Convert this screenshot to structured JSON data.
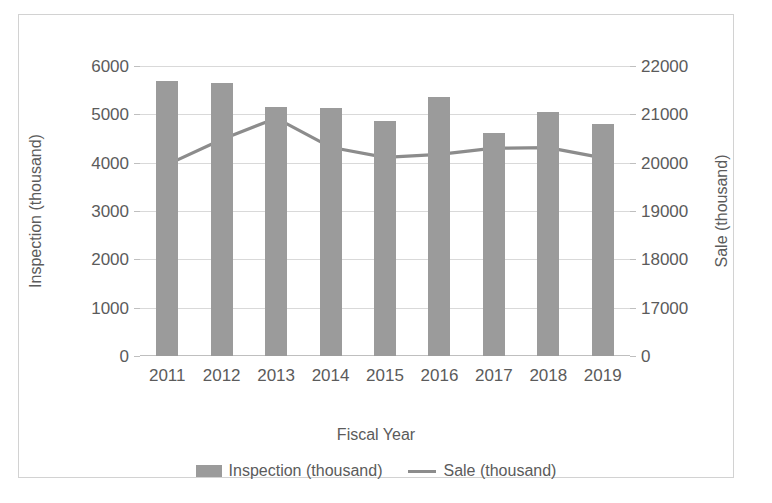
{
  "chart_data": {
    "type": "bar",
    "title": "",
    "xlabel": "Fiscal Year",
    "categories": [
      "2011",
      "2012",
      "2013",
      "2014",
      "2015",
      "2016",
      "2017",
      "2018",
      "2019"
    ],
    "grid": true,
    "legend_position": "bottom",
    "series": [
      {
        "name": "Inspection (thousand)",
        "type": "bar",
        "axis": "left",
        "color": "#9b9b9b",
        "values": [
          5700,
          5650,
          5150,
          5130,
          4870,
          5350,
          4610,
          5050,
          4800
        ]
      },
      {
        "name": "Sale (thousand)",
        "type": "line",
        "axis": "right",
        "color": "#8c8c8c",
        "values": [
          19960,
          20480,
          20920,
          20320,
          20110,
          20170,
          20300,
          20310,
          20100
        ]
      }
    ],
    "left_axis": {
      "label": "Inspection (thousand)",
      "ticks": [
        "6000",
        "5000",
        "4000",
        "3000",
        "2000",
        "1000",
        "0"
      ],
      "tick_values": [
        6000,
        5000,
        4000,
        3000,
        2000,
        1000,
        0
      ],
      "ylim": [
        0,
        6000
      ]
    },
    "right_axis": {
      "label": "Sale (thousand)",
      "ticks": [
        "22000",
        "21000",
        "20000",
        "19000",
        "18000",
        "17000",
        "0"
      ],
      "tick_values": [
        22000,
        21000,
        20000,
        19000,
        18000,
        17000,
        16000
      ],
      "ylim": [
        16000,
        22000
      ]
    }
  },
  "legend": {
    "items": [
      {
        "label": "Inspection (thousand)",
        "marker": "bar-swatch"
      },
      {
        "label": "Sale (thousand)",
        "marker": "line-swatch"
      }
    ]
  }
}
